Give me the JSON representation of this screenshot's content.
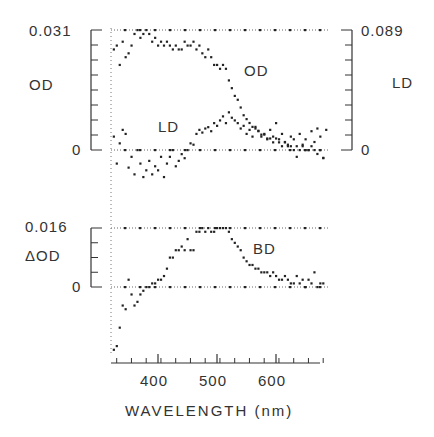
{
  "chart_data": [
    {
      "panel": "top",
      "type": "scatter",
      "xlabel": "WAVELENGTH (nm)",
      "x_ticks": [
        400,
        500,
        600
      ],
      "xlim": [
        320,
        690
      ],
      "left_axis": {
        "label": "OD",
        "top_label": "0.031",
        "zero_label": "0",
        "ylim": [
          0,
          0.031
        ]
      },
      "right_axis": {
        "label": "LD",
        "top_label": "0.089",
        "zero_label": "0",
        "ylim": [
          0,
          0.089
        ]
      },
      "grid": "dotted lines at top and zero",
      "series": [
        {
          "name": "OD",
          "axis": "left",
          "annotation": "OD",
          "points": [
            [
              325,
              0.026
            ],
            [
              330,
              0.027
            ],
            [
              335,
              0.022
            ],
            [
              340,
              0.028
            ],
            [
              345,
              0.024
            ],
            [
              350,
              0.025
            ],
            [
              355,
              0.027
            ],
            [
              360,
              0.03
            ],
            [
              365,
              0.031
            ],
            [
              370,
              0.029
            ],
            [
              375,
              0.03
            ],
            [
              380,
              0.031
            ],
            [
              385,
              0.03
            ],
            [
              390,
              0.028
            ],
            [
              395,
              0.029
            ],
            [
              400,
              0.027
            ],
            [
              405,
              0.028
            ],
            [
              410,
              0.027
            ],
            [
              415,
              0.028
            ],
            [
              420,
              0.027
            ],
            [
              425,
              0.026
            ],
            [
              430,
              0.027
            ],
            [
              435,
              0.026
            ],
            [
              440,
              0.026
            ],
            [
              445,
              0.028
            ],
            [
              450,
              0.027
            ],
            [
              455,
              0.027
            ],
            [
              460,
              0.028
            ],
            [
              465,
              0.026
            ],
            [
              470,
              0.027
            ],
            [
              475,
              0.025
            ],
            [
              480,
              0.024
            ],
            [
              485,
              0.026
            ],
            [
              490,
              0.024
            ],
            [
              495,
              0.022
            ],
            [
              500,
              0.022
            ],
            [
              505,
              0.021
            ],
            [
              510,
              0.022
            ],
            [
              515,
              0.021
            ],
            [
              520,
              0.018
            ],
            [
              525,
              0.016
            ],
            [
              530,
              0.014
            ],
            [
              535,
              0.013
            ],
            [
              540,
              0.011
            ],
            [
              545,
              0.009
            ],
            [
              550,
              0.008
            ],
            [
              555,
              0.007
            ],
            [
              560,
              0.006
            ],
            [
              565,
              0.006
            ],
            [
              570,
              0.005
            ],
            [
              575,
              0.004
            ],
            [
              580,
              0.004
            ],
            [
              585,
              0.003
            ],
            [
              590,
              0.003
            ],
            [
              595,
              0.002
            ],
            [
              600,
              0.003
            ],
            [
              605,
              0.002
            ],
            [
              610,
              0.001
            ],
            [
              615,
              0.002
            ],
            [
              620,
              0.001
            ],
            [
              625,
              0.001
            ],
            [
              630,
              0.0
            ],
            [
              635,
              0.001
            ],
            [
              640,
              0.0
            ],
            [
              645,
              0.001
            ],
            [
              650,
              0.0
            ],
            [
              655,
              0.0
            ],
            [
              660,
              0.001
            ],
            [
              665,
              0.0
            ],
            [
              670,
              -0.001
            ],
            [
              675,
              0.0
            ],
            [
              680,
              -0.002
            ]
          ]
        },
        {
          "name": "LD",
          "axis": "right",
          "annotation": "LD",
          "points": [
            [
              325,
              0.01
            ],
            [
              330,
              -0.01
            ],
            [
              335,
              0.005
            ],
            [
              340,
              0.015
            ],
            [
              345,
              0.012
            ],
            [
              350,
              -0.013
            ],
            [
              355,
              -0.005
            ],
            [
              360,
              -0.018
            ],
            [
              365,
              0.0
            ],
            [
              370,
              -0.01
            ],
            [
              375,
              -0.02
            ],
            [
              380,
              -0.015
            ],
            [
              385,
              -0.008
            ],
            [
              390,
              -0.018
            ],
            [
              395,
              -0.012
            ],
            [
              400,
              -0.015
            ],
            [
              405,
              -0.005
            ],
            [
              410,
              -0.02
            ],
            [
              415,
              -0.01
            ],
            [
              420,
              -0.005
            ],
            [
              425,
              0.0
            ],
            [
              430,
              -0.012
            ],
            [
              435,
              -0.008
            ],
            [
              440,
              -0.003
            ],
            [
              445,
              -0.006
            ],
            [
              450,
              0.0
            ],
            [
              455,
              0.005
            ],
            [
              460,
              0.004
            ],
            [
              465,
              0.012
            ],
            [
              470,
              0.015
            ],
            [
              475,
              0.013
            ],
            [
              480,
              0.016
            ],
            [
              485,
              0.017
            ],
            [
              490,
              0.014
            ],
            [
              495,
              0.02
            ],
            [
              500,
              0.018
            ],
            [
              505,
              0.022
            ],
            [
              510,
              0.025
            ],
            [
              515,
              0.02
            ],
            [
              520,
              0.028
            ],
            [
              525,
              0.024
            ],
            [
              530,
              0.022
            ],
            [
              535,
              0.02
            ],
            [
              540,
              0.016
            ],
            [
              545,
              0.018
            ],
            [
              550,
              0.012
            ],
            [
              555,
              0.015
            ],
            [
              560,
              0.01
            ],
            [
              565,
              0.016
            ],
            [
              570,
              0.014
            ],
            [
              575,
              0.01
            ],
            [
              580,
              0.012
            ],
            [
              585,
              0.008
            ],
            [
              590,
              0.015
            ],
            [
              595,
              0.01
            ],
            [
              600,
              0.02
            ],
            [
              605,
              0.008
            ],
            [
              610,
              0.012
            ],
            [
              615,
              0.006
            ],
            [
              620,
              0.004
            ],
            [
              625,
              0.01
            ],
            [
              630,
              0.008
            ],
            [
              635,
              -0.005
            ],
            [
              640,
              0.012
            ],
            [
              645,
              0.004
            ],
            [
              650,
              0.008
            ],
            [
              655,
              0.0
            ],
            [
              660,
              0.014
            ],
            [
              665,
              0.006
            ],
            [
              670,
              0.016
            ],
            [
              675,
              0.01
            ],
            [
              680,
              -0.006
            ],
            [
              685,
              0.015
            ]
          ]
        }
      ]
    },
    {
      "panel": "bottom",
      "type": "scatter",
      "xlabel": "WAVELENGTH (nm)",
      "x_ticks": [
        400,
        500,
        600
      ],
      "xlim": [
        320,
        690
      ],
      "left_axis": {
        "label": "ΔOD",
        "top_label": "0.016",
        "zero_label": "0",
        "ylim": [
          -0.016,
          0.016
        ]
      },
      "grid": "dotted lines at 0.016 and zero",
      "series": [
        {
          "name": "BD",
          "annotation": "BD",
          "points": [
            [
              325,
              -0.017
            ],
            [
              330,
              -0.016
            ],
            [
              335,
              -0.011
            ],
            [
              340,
              -0.005
            ],
            [
              345,
              -0.006
            ],
            [
              350,
              0.002
            ],
            [
              355,
              -0.002
            ],
            [
              360,
              -0.005
            ],
            [
              365,
              -0.004
            ],
            [
              370,
              -0.002
            ],
            [
              375,
              -0.001
            ],
            [
              380,
              0.0
            ],
            [
              385,
              0.0
            ],
            [
              390,
              0.001
            ],
            [
              395,
              0.001
            ],
            [
              400,
              0.002
            ],
            [
              405,
              0.002
            ],
            [
              410,
              0.003
            ],
            [
              415,
              0.005
            ],
            [
              420,
              0.008
            ],
            [
              425,
              0.008
            ],
            [
              430,
              0.01
            ],
            [
              435,
              0.01
            ],
            [
              440,
              0.011
            ],
            [
              445,
              0.01
            ],
            [
              450,
              0.013
            ],
            [
              455,
              0.01
            ],
            [
              460,
              0.01
            ],
            [
              465,
              0.015
            ],
            [
              470,
              0.015
            ],
            [
              475,
              0.016
            ],
            [
              480,
              0.015
            ],
            [
              485,
              0.016
            ],
            [
              490,
              0.015
            ],
            [
              495,
              0.015
            ],
            [
              500,
              0.016
            ],
            [
              505,
              0.016
            ],
            [
              510,
              0.016
            ],
            [
              515,
              0.016
            ],
            [
              520,
              0.015
            ],
            [
              525,
              0.013
            ],
            [
              530,
              0.012
            ],
            [
              535,
              0.011
            ],
            [
              540,
              0.01
            ],
            [
              545,
              0.008
            ],
            [
              550,
              0.007
            ],
            [
              555,
              0.006
            ],
            [
              560,
              0.006
            ],
            [
              565,
              0.005
            ],
            [
              570,
              0.005
            ],
            [
              575,
              0.004
            ],
            [
              580,
              0.004
            ],
            [
              585,
              0.004
            ],
            [
              590,
              0.003
            ],
            [
              595,
              0.004
            ],
            [
              600,
              0.003
            ],
            [
              605,
              0.002
            ],
            [
              610,
              0.002
            ],
            [
              615,
              0.003
            ],
            [
              620,
              0.002
            ],
            [
              625,
              0.001
            ],
            [
              630,
              0.001
            ],
            [
              635,
              0.003
            ],
            [
              640,
              0.001
            ],
            [
              645,
              0.002
            ],
            [
              650,
              0.0
            ],
            [
              655,
              0.002
            ],
            [
              660,
              0.001
            ],
            [
              665,
              0.004
            ],
            [
              670,
              0.0
            ],
            [
              675,
              0.001
            ],
            [
              680,
              0.001
            ]
          ]
        }
      ]
    }
  ],
  "labels": {
    "top_left_max": "0.031",
    "top_left_axis": "OD",
    "top_left_zero": "0",
    "top_right_max": "0.089",
    "top_right_axis": "LD",
    "top_right_zero": "0",
    "od_annotation": "OD",
    "ld_annotation": "LD",
    "bottom_max": "0.016",
    "bottom_axis": "ΔOD",
    "bottom_zero": "0",
    "bd_annotation": "BD",
    "x400": "400",
    "x500": "500",
    "x600": "600",
    "xlabel": "WAVELENGTH (nm)"
  }
}
